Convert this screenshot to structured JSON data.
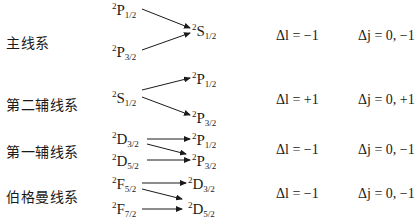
{
  "series": [
    {
      "name": "主线系",
      "left_terms": [
        {
          "mult": "2",
          "L": "P",
          "j": "1/2"
        },
        {
          "mult": "2",
          "L": "P",
          "j": "3/2"
        }
      ],
      "right_terms": [
        {
          "mult": "2",
          "L": "S",
          "j": "1/2"
        }
      ],
      "delta_l": "Δl = −1",
      "delta_j": "Δj = 0, −1"
    },
    {
      "name": "第二辅线系",
      "left_terms": [
        {
          "mult": "2",
          "L": "S",
          "j": "1/2"
        }
      ],
      "right_terms": [
        {
          "mult": "2",
          "L": "P",
          "j": "1/2"
        },
        {
          "mult": "2",
          "L": "P",
          "j": "3/2"
        }
      ],
      "delta_l": "Δl = +1",
      "delta_j": "Δj = 0, +1"
    },
    {
      "name": "第一辅线系",
      "left_terms": [
        {
          "mult": "2",
          "L": "D",
          "j": "3/2"
        },
        {
          "mult": "2",
          "L": "D",
          "j": "5/2"
        }
      ],
      "right_terms": [
        {
          "mult": "2",
          "L": "P",
          "j": "1/2"
        },
        {
          "mult": "2",
          "L": "P",
          "j": "3/2"
        }
      ],
      "delta_l": "Δl = −1",
      "delta_j": "Δj = 0, −1"
    },
    {
      "name": "伯格曼线系",
      "left_terms": [
        {
          "mult": "2",
          "L": "F",
          "j": "5/2"
        },
        {
          "mult": "2",
          "L": "F",
          "j": "7/2"
        }
      ],
      "right_terms": [
        {
          "mult": "2",
          "L": "D",
          "j": "3/2"
        },
        {
          "mult": "2",
          "L": "D",
          "j": "5/2"
        }
      ],
      "delta_l": "Δl = −1",
      "delta_j": "Δj = 0, −1"
    }
  ]
}
